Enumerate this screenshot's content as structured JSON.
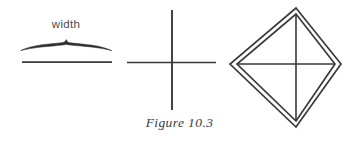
{
  "figure": {
    "caption": "Figure 10.3",
    "background_color": "#ffffff",
    "ink_color": "#333333",
    "panels": [
      {
        "id": "panel-width-brace",
        "name": "width-brace-panel",
        "label": "width",
        "description": "A horizontal line with a hand-drawn curly brace above it annotated 'width'",
        "elements": [
          {
            "type": "brace",
            "name": "width-brace",
            "x_start": 20,
            "x_end": 112,
            "y_baseline": 50,
            "y_peak": 42
          },
          {
            "type": "line",
            "name": "horizontal-baseline",
            "x_start": 22,
            "x_end": 112,
            "y": 62
          }
        ]
      },
      {
        "id": "panel-cross",
        "name": "cross-panel",
        "label": "",
        "description": "A plain cross made of one vertical and one horizontal stroke",
        "elements": [
          {
            "type": "line",
            "name": "cross-vertical-line",
            "x": 172,
            "y_start": 10,
            "y_end": 110
          },
          {
            "type": "line",
            "name": "cross-horizontal-line",
            "y": 62,
            "x_start": 127,
            "x_end": 216
          }
        ]
      },
      {
        "id": "panel-diamond",
        "name": "diamond-panel",
        "label": "",
        "description": "A double-outlined diamond containing an inscribed cross joining opposite vertices",
        "elements": [
          {
            "type": "polygon",
            "name": "outer-diamond",
            "vertices": [
              [
                296,
                8
              ],
              [
                341,
                64
              ],
              [
                296,
                127
              ],
              [
                230,
                64
              ]
            ]
          },
          {
            "type": "polygon",
            "name": "inner-diamond",
            "vertices": [
              [
                296,
                14
              ],
              [
                335,
                64
              ],
              [
                296,
                121
              ],
              [
                237,
                64
              ]
            ]
          },
          {
            "type": "line",
            "name": "diamond-vertical-diagonal",
            "x": 296,
            "y_start": 14,
            "y_end": 121
          },
          {
            "type": "line",
            "name": "diamond-horizontal-diagonal",
            "y": 64,
            "x_start": 237,
            "x_end": 335
          }
        ]
      }
    ]
  }
}
